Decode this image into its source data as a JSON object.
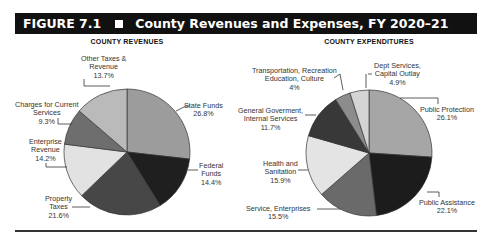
{
  "figure": {
    "number": "FIGURE 7.1",
    "title": "County Revenues and Expenses, FY 2020–21"
  },
  "chart_data": [
    {
      "type": "pie",
      "title": "COUNTY REVENUES",
      "start_angle": "12 o'clock, clockwise",
      "slices": [
        {
          "label": "State Funds",
          "value": 26.8,
          "display": "26.8%",
          "color": "#9c9c9c"
        },
        {
          "label": "Federal Funds",
          "value": 14.4,
          "display": "14.4%",
          "color": "#1f1f1f"
        },
        {
          "label": "Property Taxes",
          "value": 21.6,
          "display": "21.6%",
          "color": "#474747"
        },
        {
          "label": "Enterprise Revenue",
          "value": 14.2,
          "display": "14.2%",
          "color": "#e2e2e2"
        },
        {
          "label": "Charges for Current Services",
          "value": 9.3,
          "display": "9.3%",
          "color": "#6e6e6e"
        },
        {
          "label": "Other Taxes & Revenue",
          "value": 13.7,
          "display": "13.7%",
          "color": "#bababa"
        }
      ]
    },
    {
      "type": "pie",
      "title": "COUNTY EXPENDITURES",
      "start_angle": "12 o'clock, clockwise",
      "slices": [
        {
          "label": "Public Protection",
          "value": 26.1,
          "display": "26.1%",
          "color": "#a6a6a6"
        },
        {
          "label": "Public Assistance",
          "value": 22.1,
          "display": "22.1%",
          "color": "#1c1c1c"
        },
        {
          "label": "Service, Enterprises",
          "value": 15.5,
          "display": "15.5%",
          "color": "#6a6a6a"
        },
        {
          "label": "Health and Sanitation",
          "value": 15.9,
          "display": "15.9%",
          "color": "#e4e4e4"
        },
        {
          "label": "General Goverment, Internal Services",
          "value": 11.7,
          "display": "11.7%",
          "color": "#383838"
        },
        {
          "label": "Transportation, Recreation Education, Culture",
          "value": 4,
          "display": "4%",
          "color": "#8c8c8c"
        },
        {
          "label": "Dept Services, Capital Outlay",
          "value": 4.9,
          "display": "4.9%",
          "color": "#d4d4d4"
        }
      ]
    }
  ],
  "labels": {
    "rev": {
      "state": [
        "State Funds",
        "26.8%"
      ],
      "federal": [
        "Federal",
        "Funds",
        "14.4%"
      ],
      "property": [
        "Property",
        "Taxes",
        "21.6%"
      ],
      "enterprise": [
        "Enterprise",
        "Revenue",
        "14.2%"
      ],
      "charges": [
        "Charges for Current",
        "Services",
        "9.3%"
      ],
      "other": [
        "Other Taxes &",
        "Revenue",
        "13.7%"
      ]
    },
    "exp": {
      "protection": [
        "Public Protection",
        "26.1%"
      ],
      "assistance": [
        "Public Assistance",
        "22.1%"
      ],
      "service": [
        "Service, Enterprises",
        "15.5%"
      ],
      "health": [
        "Health and",
        "Sanitation",
        "15.9%"
      ],
      "general": [
        "General Goverment,",
        "Internal Services",
        "11.7%"
      ],
      "transport": [
        "Transportation, Recreation",
        "Education, Culture",
        "4%"
      ],
      "dept": [
        "Dept Services,",
        "Capital Outlay",
        "4.9%"
      ]
    }
  }
}
